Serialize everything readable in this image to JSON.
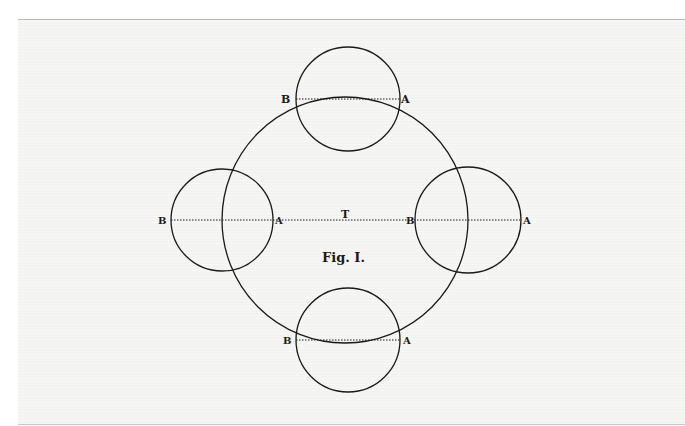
{
  "figure": {
    "caption": "Fig. I.",
    "center_label": "T",
    "colors": {
      "background": "#f3f3f2",
      "ink": "#1a1a1a",
      "border": "#b8b8b8"
    },
    "central_circle": {
      "label": "T",
      "cx": 345,
      "cy": 220,
      "r": 123
    },
    "satellites": [
      {
        "position": "top",
        "cx": 348,
        "cy": 99,
        "r": 52,
        "chord": {
          "x1": 296,
          "y1": 99,
          "x2": 400,
          "y2": 99
        },
        "label_b": "B",
        "label_a": "A"
      },
      {
        "position": "left",
        "cx": 222,
        "cy": 220,
        "r": 51,
        "chord": {
          "x1": 171,
          "y1": 220,
          "x2": 273,
          "y2": 220
        },
        "label_b": "B",
        "label_a": "A"
      },
      {
        "position": "right",
        "cx": 468,
        "cy": 220,
        "r": 53,
        "chord": {
          "x1": 415,
          "y1": 220,
          "x2": 521,
          "y2": 220
        },
        "label_b": "B",
        "label_a": "A"
      },
      {
        "position": "bottom",
        "cx": 348,
        "cy": 340,
        "r": 52,
        "chord": {
          "x1": 296,
          "y1": 340,
          "x2": 400,
          "y2": 340
        },
        "label_b": "B",
        "label_a": "A"
      }
    ],
    "labels": {
      "top_b": "B",
      "top_a": "A",
      "left_b": "B",
      "left_a": "A",
      "right_b": "B",
      "right_a": "A",
      "bottom_b": "B",
      "bottom_a": "A"
    }
  }
}
